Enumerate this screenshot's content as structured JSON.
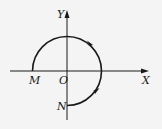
{
  "diagram": {
    "type": "coordinate-path",
    "axes": {
      "x_label": "X",
      "y_label": "Y",
      "origin_label": "O"
    },
    "points": [
      {
        "id": "M",
        "label": "M",
        "position": "negative x-axis, on circle"
      },
      {
        "id": "N",
        "label": "N",
        "position": "negative y-axis, on circle"
      }
    ],
    "arc": {
      "center": "O",
      "start": "M",
      "end": "N",
      "direction": "clockwise",
      "sweep_degrees": 270,
      "arrow_count": 2
    },
    "colors": {
      "ink": "#1a1a1a",
      "background": "#f4f4f4"
    }
  }
}
